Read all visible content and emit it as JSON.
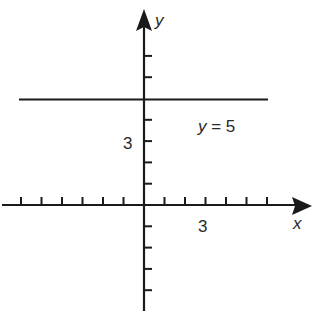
{
  "chart_data": {
    "type": "line",
    "title": "",
    "xlabel": "x",
    "ylabel": "y",
    "xlim": [
      -7,
      8
    ],
    "ylim": [
      -5,
      9
    ],
    "grid": false,
    "x_tick_step": 1,
    "y_tick_step": 1,
    "x_tick_labels": [
      {
        "value": 3,
        "label": "3"
      }
    ],
    "y_tick_labels": [
      {
        "value": 3,
        "label": "3"
      }
    ],
    "series": [
      {
        "name": "y = 5",
        "equation": "y = 5",
        "x": [
          -6,
          6
        ],
        "y": [
          5,
          5
        ]
      }
    ],
    "annotations": [
      {
        "text": "y = 5",
        "x": 3,
        "y": 4
      }
    ]
  },
  "labels": {
    "x_axis": "x",
    "y_axis": "y",
    "x_tick_3": "3",
    "y_tick_3": "3",
    "line_label": "y = 5"
  }
}
